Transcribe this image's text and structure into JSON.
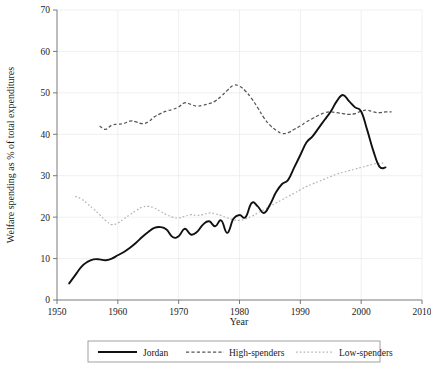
{
  "chart_data": {
    "type": "line",
    "title": "",
    "xlabel": "Year",
    "ylabel": "Welfare spending as % of total expenditures",
    "xlim": [
      1950,
      2010
    ],
    "ylim": [
      0,
      70
    ],
    "xticks": [
      1950,
      1960,
      1970,
      1980,
      1990,
      2000,
      2010
    ],
    "yticks": [
      0,
      10,
      20,
      30,
      40,
      50,
      60,
      70
    ],
    "xtick_labels": [
      "1950",
      "1960",
      "1970",
      "1980",
      "1990",
      "2000",
      "2010"
    ],
    "ytick_labels": [
      "0",
      "10",
      "20",
      "30",
      "40",
      "50",
      "60",
      "70"
    ],
    "grid": true,
    "legend_position": "bottom",
    "series": [
      {
        "name": "Jordan",
        "style": "solid",
        "color": "#111111",
        "x": [
          1952,
          1953,
          1954,
          1955,
          1956,
          1957,
          1958,
          1959,
          1960,
          1961,
          1962,
          1963,
          1964,
          1965,
          1966,
          1967,
          1968,
          1969,
          1970,
          1971,
          1972,
          1973,
          1974,
          1975,
          1976,
          1977,
          1978,
          1979,
          1980,
          1981,
          1982,
          1983,
          1984,
          1985,
          1986,
          1987,
          1988,
          1989,
          1990,
          1991,
          1992,
          1993,
          1994,
          1995,
          1996,
          1997,
          1998,
          1999,
          2000,
          2001,
          2002,
          2003,
          2004
        ],
        "values": [
          4.0,
          6.0,
          8.0,
          9.2,
          9.8,
          9.8,
          9.6,
          10.0,
          10.8,
          11.6,
          12.6,
          13.8,
          15.2,
          16.4,
          17.4,
          17.6,
          17.0,
          15.2,
          15.4,
          17.2,
          15.8,
          16.4,
          18.2,
          19.0,
          17.8,
          19.2,
          16.2,
          19.6,
          20.5,
          20.0,
          23.4,
          22.6,
          21.0,
          23.0,
          26.0,
          28.0,
          29.0,
          32.0,
          35.0,
          38.0,
          39.5,
          41.5,
          43.5,
          45.5,
          48.0,
          49.5,
          48.0,
          46.5,
          45.5,
          41.0,
          36.0,
          32.2,
          32.0
        ]
      },
      {
        "name": "High-spenders",
        "style": "dashed",
        "color": "#555555",
        "x": [
          1957,
          1958,
          1959,
          1960,
          1961,
          1962,
          1963,
          1964,
          1965,
          1966,
          1967,
          1968,
          1969,
          1970,
          1971,
          1972,
          1973,
          1974,
          1975,
          1976,
          1977,
          1978,
          1979,
          1980,
          1981,
          1982,
          1983,
          1984,
          1985,
          1986,
          1987,
          1988,
          1989,
          1990,
          1991,
          1992,
          1993,
          1994,
          1995,
          1996,
          1997,
          1998,
          1999,
          2000,
          2001,
          2002,
          2003,
          2004,
          2005
        ],
        "values": [
          42.0,
          41.2,
          42.2,
          42.4,
          42.6,
          43.2,
          43.0,
          42.6,
          43.0,
          44.2,
          45.0,
          45.6,
          46.0,
          46.6,
          47.6,
          47.2,
          46.8,
          47.0,
          47.4,
          48.0,
          49.2,
          50.6,
          51.8,
          51.6,
          50.4,
          48.6,
          46.4,
          44.0,
          42.2,
          41.0,
          40.2,
          40.4,
          41.2,
          42.0,
          43.0,
          43.8,
          44.6,
          45.2,
          45.4,
          45.2,
          45.0,
          44.8,
          45.0,
          45.6,
          45.8,
          45.4,
          45.2,
          45.4,
          45.4
        ]
      },
      {
        "name": "Low-spenders",
        "style": "dotted",
        "color": "#b4b4b4",
        "x": [
          1953,
          1954,
          1955,
          1956,
          1957,
          1958,
          1959,
          1960,
          1961,
          1962,
          1963,
          1964,
          1965,
          1966,
          1967,
          1968,
          1969,
          1970,
          1971,
          1972,
          1973,
          1974,
          1975,
          1976,
          1977,
          1978,
          1979,
          1980,
          1981,
          1982,
          1983,
          1984,
          1985,
          1986,
          1987,
          1988,
          1989,
          1990,
          1991,
          1992,
          1993,
          1994,
          1995,
          1996,
          1997,
          1998,
          1999,
          2000,
          2001,
          2002,
          2003,
          2004
        ],
        "values": [
          25.0,
          24.4,
          23.2,
          22.0,
          20.6,
          19.2,
          18.2,
          18.6,
          19.6,
          20.6,
          21.6,
          22.4,
          22.6,
          22.2,
          21.4,
          20.6,
          20.0,
          19.8,
          20.2,
          20.6,
          20.4,
          20.6,
          21.0,
          20.8,
          20.4,
          19.8,
          19.4,
          19.2,
          19.6,
          20.2,
          21.0,
          21.8,
          22.6,
          23.4,
          24.2,
          25.0,
          25.8,
          26.6,
          27.4,
          28.0,
          28.6,
          29.2,
          29.8,
          30.4,
          30.8,
          31.2,
          31.6,
          32.0,
          32.4,
          32.8,
          33.0,
          33.0
        ]
      }
    ]
  },
  "legend": {
    "entries": [
      {
        "label": "Jordan",
        "style": "solid"
      },
      {
        "label": "High-spenders",
        "style": "dashed"
      },
      {
        "label": "Low-spenders",
        "style": "dotted"
      }
    ]
  },
  "colors": {
    "jordan": "#111111",
    "high_spenders": "#555555",
    "low_spenders": "#b4b4b4",
    "grid": "#e9e9e9",
    "axis": "#6b6b6b",
    "background": "#ffffff"
  }
}
